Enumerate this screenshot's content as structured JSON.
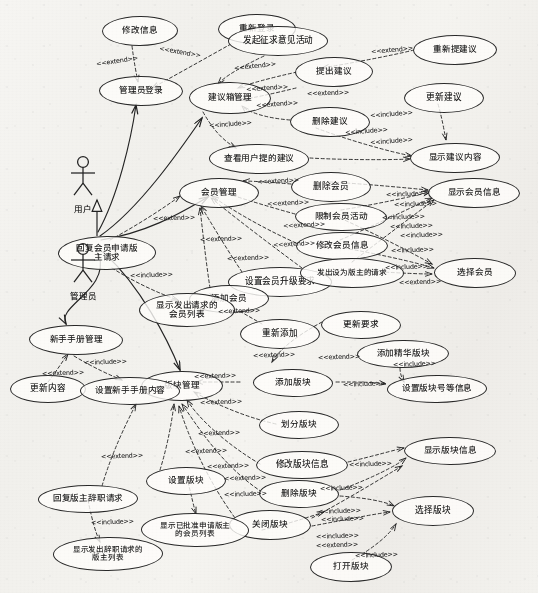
{
  "diagram": {
    "type": "uml-use-case-diagram",
    "background_color": "#f1f0ec",
    "stroke_color": "#2b2b2b",
    "actors": [
      {
        "id": "user",
        "label": "用户",
        "x": 83,
        "y": 155
      },
      {
        "id": "admin",
        "label": "管理员",
        "x": 83,
        "y": 242
      }
    ],
    "generalization": {
      "from": "admin",
      "to": "user",
      "label": ""
    },
    "use_cases": [
      {
        "id": "uc_modify_info",
        "label": "修改信息",
        "x": 102,
        "y": 16,
        "w": 76,
        "h": 30
      },
      {
        "id": "uc_relogin",
        "label": "重新登录",
        "x": 218,
        "y": 14,
        "w": 78,
        "h": 30
      },
      {
        "id": "uc_start_opinion",
        "label": "发起征求意见活动",
        "x": 228,
        "y": 26,
        "w": 100,
        "h": 30
      },
      {
        "id": "uc_admin_login",
        "label": "管理员登录",
        "x": 99,
        "y": 76,
        "w": 84,
        "h": 30
      },
      {
        "id": "uc_suggest_box_mgmt",
        "label": "建议箱管理",
        "x": 189,
        "y": 82,
        "w": 82,
        "h": 32
      },
      {
        "id": "uc_submit_suggest",
        "label": "提出建议",
        "x": 295,
        "y": 57,
        "w": 78,
        "h": 30
      },
      {
        "id": "uc_resubmit_suggest",
        "label": "重新提建议",
        "x": 413,
        "y": 35,
        "w": 84,
        "h": 30
      },
      {
        "id": "uc_update_suggest",
        "label": "更新建议",
        "x": 404,
        "y": 83,
        "w": 80,
        "h": 30
      },
      {
        "id": "uc_delete_suggest",
        "label": "删除建议",
        "x": 290,
        "y": 107,
        "w": 80,
        "h": 30
      },
      {
        "id": "uc_view_user_suggest",
        "label": "查看用户提的建议",
        "x": 209,
        "y": 144,
        "w": 100,
        "h": 30
      },
      {
        "id": "uc_show_suggest_body",
        "label": "显示建议内容",
        "x": 410,
        "y": 143,
        "w": 90,
        "h": 30
      },
      {
        "id": "uc_member_mgmt",
        "label": "会员管理",
        "x": 179,
        "y": 178,
        "w": 80,
        "h": 30
      },
      {
        "id": "uc_delete_member",
        "label": "删除会员",
        "x": 291,
        "y": 172,
        "w": 80,
        "h": 30
      },
      {
        "id": "uc_show_member_info",
        "label": "显示会员信息",
        "x": 428,
        "y": 178,
        "w": 92,
        "h": 30
      },
      {
        "id": "uc_limit_member_act",
        "label": "限制会员活动",
        "x": 295,
        "y": 203,
        "w": 92,
        "h": 28
      },
      {
        "id": "uc_reply_apply_mod",
        "label": "回复会员申请版\n主请求",
        "x": 58,
        "y": 236,
        "w": 98,
        "h": 34
      },
      {
        "id": "uc_modify_member_info",
        "label": "修改会员信息",
        "x": 296,
        "y": 232,
        "w": 92,
        "h": 28
      },
      {
        "id": "uc_set_upgrade_req",
        "label": "设置会员升级要求",
        "x": 228,
        "y": 267,
        "w": 104,
        "h": 30
      },
      {
        "id": "uc_send_mod_request",
        "label": "发出设为版主的请求",
        "x": 300,
        "y": 258,
        "w": 104,
        "h": 30
      },
      {
        "id": "uc_select_member",
        "label": "选择会员",
        "x": 434,
        "y": 258,
        "w": 82,
        "h": 30
      },
      {
        "id": "uc_add_member",
        "label": "添加会员",
        "x": 189,
        "y": 285,
        "w": 80,
        "h": 28
      },
      {
        "id": "uc_show_req_members",
        "label": "显示发出请求的\n会员列表",
        "x": 139,
        "y": 293,
        "w": 96,
        "h": 34
      },
      {
        "id": "uc_readd",
        "label": "重新添加",
        "x": 240,
        "y": 319,
        "w": 80,
        "h": 30
      },
      {
        "id": "uc_update_req",
        "label": "更新要求",
        "x": 321,
        "y": 311,
        "w": 80,
        "h": 28
      },
      {
        "id": "uc_newbie_mgmt",
        "label": "新手手册管理",
        "x": 29,
        "y": 325,
        "w": 94,
        "h": 30
      },
      {
        "id": "uc_add_elite_board",
        "label": "添加精华版块",
        "x": 357,
        "y": 340,
        "w": 92,
        "h": 28
      },
      {
        "id": "uc_board_mgmt",
        "label": "版块管理",
        "x": 141,
        "y": 371,
        "w": 82,
        "h": 30
      },
      {
        "id": "uc_update_content",
        "label": "更新内容",
        "x": 10,
        "y": 375,
        "w": 76,
        "h": 28
      },
      {
        "id": "uc_set_newbie_content",
        "label": "设置新手手册内容",
        "x": 80,
        "y": 377,
        "w": 100,
        "h": 28
      },
      {
        "id": "uc_add_board",
        "label": "添加版块",
        "x": 253,
        "y": 369,
        "w": 80,
        "h": 28
      },
      {
        "id": "uc_set_board_no",
        "label": "设置版块号等信息",
        "x": 387,
        "y": 375,
        "w": 100,
        "h": 28
      },
      {
        "id": "uc_divide_board",
        "label": "划分版块",
        "x": 259,
        "y": 411,
        "w": 80,
        "h": 28
      },
      {
        "id": "uc_modify_board_info",
        "label": "修改版块信息",
        "x": 256,
        "y": 451,
        "w": 92,
        "h": 28
      },
      {
        "id": "uc_show_board_info",
        "label": "显示版块信息",
        "x": 404,
        "y": 437,
        "w": 92,
        "h": 28
      },
      {
        "id": "uc_delete_board",
        "label": "删除版块",
        "x": 259,
        "y": 480,
        "w": 80,
        "h": 28
      },
      {
        "id": "uc_reply_mod_resign",
        "label": "回复版主辞职请求",
        "x": 38,
        "y": 485,
        "w": 100,
        "h": 28
      },
      {
        "id": "uc_set_board",
        "label": "设置版块",
        "x": 146,
        "y": 467,
        "w": 80,
        "h": 28
      },
      {
        "id": "uc_select_board",
        "label": "选择版块",
        "x": 392,
        "y": 496,
        "w": 82,
        "h": 30
      },
      {
        "id": "uc_close_board",
        "label": "关闭版块",
        "x": 229,
        "y": 510,
        "w": 82,
        "h": 30
      },
      {
        "id": "uc_show_approved_list",
        "label": "显示已批准申请版主\n的会员列表",
        "x": 141,
        "y": 513,
        "w": 108,
        "h": 34
      },
      {
        "id": "uc_show_resign_list",
        "label": "显示发出辞职请求的\n版主列表",
        "x": 53,
        "y": 537,
        "w": 110,
        "h": 34
      },
      {
        "id": "uc_open_board",
        "label": "打开版块",
        "x": 310,
        "y": 552,
        "w": 82,
        "h": 30
      }
    ],
    "stereotypes": {
      "extend": "<<extend>>",
      "include": "<<include>>"
    },
    "stereotype_labels": [
      {
        "text": "<<extend>>",
        "x": 96,
        "y": 57,
        "rot": -8
      },
      {
        "text": "<<extend>>",
        "x": 159,
        "y": 48,
        "rot": 10
      },
      {
        "text": "<<extend>>",
        "x": 234,
        "y": 62,
        "rot": -6
      },
      {
        "text": "<<extend>>",
        "x": 246,
        "y": 84,
        "rot": -4
      },
      {
        "text": "<<extend>>",
        "x": 256,
        "y": 100,
        "rot": -4
      },
      {
        "text": "<<extend>>",
        "x": 307,
        "y": 89,
        "rot": -2
      },
      {
        "text": "<<extend>>",
        "x": 371,
        "y": 46,
        "rot": -5
      },
      {
        "text": "<<include>>",
        "x": 209,
        "y": 120,
        "rot": -4
      },
      {
        "text": "<<include>>",
        "x": 370,
        "y": 110,
        "rot": -4
      },
      {
        "text": "<<include>>",
        "x": 345,
        "y": 127,
        "rot": -4
      },
      {
        "text": "<<include>>",
        "x": 370,
        "y": 137,
        "rot": -4
      },
      {
        "text": "<<extend>>",
        "x": 257,
        "y": 177,
        "rot": -3
      },
      {
        "text": "<<extend>>",
        "x": 267,
        "y": 199,
        "rot": -3
      },
      {
        "text": "<<extend>>",
        "x": 283,
        "y": 221,
        "rot": -3
      },
      {
        "text": "<<extend>>",
        "x": 273,
        "y": 240,
        "rot": -3
      },
      {
        "text": "<<extend>>",
        "x": 153,
        "y": 214,
        "rot": -2
      },
      {
        "text": "<<extend>>",
        "x": 200,
        "y": 235,
        "rot": -2
      },
      {
        "text": "<<extend>>",
        "x": 227,
        "y": 254,
        "rot": -2
      },
      {
        "text": "<<include>>",
        "x": 386,
        "y": 190,
        "rot": -2
      },
      {
        "text": "<<include>>",
        "x": 394,
        "y": 200,
        "rot": -2
      },
      {
        "text": "<<include>>",
        "x": 382,
        "y": 213,
        "rot": -2
      },
      {
        "text": "<<include>>",
        "x": 390,
        "y": 222,
        "rot": -2
      },
      {
        "text": "<<include>>",
        "x": 400,
        "y": 231,
        "rot": -2
      },
      {
        "text": "<<include>>",
        "x": 391,
        "y": 246,
        "rot": -2
      },
      {
        "text": "<<include>>",
        "x": 385,
        "y": 263,
        "rot": -2
      },
      {
        "text": "<<extend>>",
        "x": 399,
        "y": 278,
        "rot": -2
      },
      {
        "text": "<<include>>",
        "x": 130,
        "y": 271,
        "rot": -2
      },
      {
        "text": "<<extend>>",
        "x": 218,
        "y": 307,
        "rot": -2
      },
      {
        "text": "<<extend>>",
        "x": 253,
        "y": 351,
        "rot": -2
      },
      {
        "text": "<<extend>>",
        "x": 318,
        "y": 353,
        "rot": -2
      },
      {
        "text": "<<extend>>",
        "x": 194,
        "y": 372,
        "rot": -2
      },
      {
        "text": "<<include>>",
        "x": 343,
        "y": 380,
        "rot": -2
      },
      {
        "text": "<<include>>",
        "x": 393,
        "y": 360,
        "rot": -2
      },
      {
        "text": "<<extend>>",
        "x": 200,
        "y": 398,
        "rot": -2
      },
      {
        "text": "<<extend>>",
        "x": 198,
        "y": 429,
        "rot": -2
      },
      {
        "text": "<<extend>>",
        "x": 185,
        "y": 447,
        "rot": -2
      },
      {
        "text": "<<extend>>",
        "x": 207,
        "y": 462,
        "rot": -2
      },
      {
        "text": "<<extend>>",
        "x": 224,
        "y": 474,
        "rot": -2
      },
      {
        "text": "<<extend>>",
        "x": 42,
        "y": 369,
        "rot": -2
      },
      {
        "text": "<<include>>",
        "x": 84,
        "y": 358,
        "rot": -2
      },
      {
        "text": "<<include>>",
        "x": 349,
        "y": 460,
        "rot": -2
      },
      {
        "text": "<<include>>",
        "x": 320,
        "y": 484,
        "rot": -2
      },
      {
        "text": "<<include>>",
        "x": 318,
        "y": 507,
        "rot": -2
      },
      {
        "text": "<<include>>",
        "x": 321,
        "y": 515,
        "rot": -2
      },
      {
        "text": "<<include>>",
        "x": 316,
        "y": 532,
        "rot": -2
      },
      {
        "text": "<<extend>>",
        "x": 316,
        "y": 541,
        "rot": -2
      },
      {
        "text": "<<include>>",
        "x": 355,
        "y": 551,
        "rot": -2
      },
      {
        "text": "<<extend>>",
        "x": 101,
        "y": 452,
        "rot": -2
      },
      {
        "text": "<<include>>",
        "x": 224,
        "y": 490,
        "rot": -2
      },
      {
        "text": "<<include>>",
        "x": 91,
        "y": 518,
        "rot": -2
      }
    ]
  }
}
